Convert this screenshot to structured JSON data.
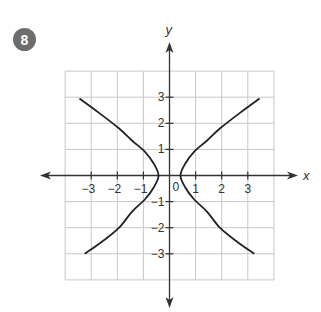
{
  "problem": {
    "number": "8"
  },
  "colors": {
    "badge": "#6d6d6d",
    "grid": "#c8c8c8",
    "axis": "#333333",
    "curve": "#222222"
  },
  "chart_data": {
    "type": "line",
    "title": "",
    "xlabel": "x",
    "ylabel": "y",
    "xlim": [
      -4,
      4
    ],
    "ylim": [
      -4,
      4
    ],
    "grid": true,
    "grid_step": 1,
    "origin_label": "0",
    "x_ticks": [
      {
        "value": -3,
        "label": "−3"
      },
      {
        "value": -2,
        "label": "−2"
      },
      {
        "value": -1,
        "label": "−1"
      },
      {
        "value": 1,
        "label": "1"
      },
      {
        "value": 2,
        "label": "2"
      },
      {
        "value": 3,
        "label": "3"
      }
    ],
    "y_ticks": [
      {
        "value": 3,
        "label": "3"
      },
      {
        "value": 2,
        "label": "2"
      },
      {
        "value": 1,
        "label": "1"
      },
      {
        "value": -1,
        "label": "−1"
      },
      {
        "value": -2,
        "label": "−2"
      },
      {
        "value": -3,
        "label": "−3"
      }
    ],
    "series": [
      {
        "name": "hyperbola-left-branch",
        "points": [
          [
            -3.45,
            2.95
          ],
          [
            -2.7,
            2.4
          ],
          [
            -1.93,
            1.8
          ],
          [
            -1.45,
            1.35
          ],
          [
            -0.93,
            0.9
          ],
          [
            -0.6,
            0.45
          ],
          [
            -0.42,
            0
          ],
          [
            -0.6,
            -0.45
          ],
          [
            -0.93,
            -0.9
          ],
          [
            -1.45,
            -1.4
          ],
          [
            -1.93,
            -2
          ],
          [
            -2.6,
            -2.55
          ],
          [
            -3.25,
            -3
          ]
        ]
      },
      {
        "name": "hyperbola-right-branch",
        "points": [
          [
            3.45,
            2.95
          ],
          [
            2.7,
            2.4
          ],
          [
            1.93,
            1.8
          ],
          [
            1.45,
            1.35
          ],
          [
            0.93,
            0.9
          ],
          [
            0.6,
            0.45
          ],
          [
            0.42,
            0
          ],
          [
            0.6,
            -0.45
          ],
          [
            0.93,
            -0.9
          ],
          [
            1.45,
            -1.4
          ],
          [
            1.93,
            -2
          ],
          [
            2.6,
            -2.55
          ],
          [
            3.25,
            -3
          ]
        ]
      }
    ]
  }
}
